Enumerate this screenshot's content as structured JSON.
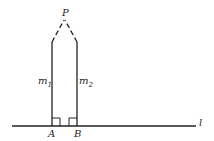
{
  "diagram": {
    "labels": {
      "point_p": "P",
      "line_l": "l",
      "foot_a": "A",
      "foot_b": "B",
      "m1_base": "m",
      "m1_sub": "1",
      "m2_base": "m",
      "m2_sub": "2"
    },
    "colors": {
      "stroke": "#222222",
      "background": "#ffffff"
    }
  }
}
